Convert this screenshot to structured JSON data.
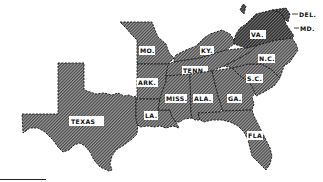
{
  "map": {
    "title": "Southern States",
    "fill_pattern": "diagonal-hatch",
    "colors": {
      "hatch": "#4a4a4a",
      "highlight_hatch": "#2e2e2e",
      "label_bg": "#ffffff",
      "border": "#1a1a1a"
    },
    "states": [
      {
        "id": "texas",
        "label": "TEXAS"
      },
      {
        "id": "missouri",
        "label": "MO."
      },
      {
        "id": "arkansas",
        "label": "ARK."
      },
      {
        "id": "louisiana",
        "label": "LA."
      },
      {
        "id": "kentucky",
        "label": "KY."
      },
      {
        "id": "tennessee",
        "label": "TENN."
      },
      {
        "id": "mississippi",
        "label": "MISS."
      },
      {
        "id": "alabama",
        "label": "ALA."
      },
      {
        "id": "georgia",
        "label": "GA."
      },
      {
        "id": "florida",
        "label": "FLA."
      },
      {
        "id": "south-carolina",
        "label": "S.C."
      },
      {
        "id": "north-carolina",
        "label": "N.C."
      },
      {
        "id": "virginia",
        "label": "VA."
      }
    ],
    "callouts": [
      {
        "id": "delaware",
        "label": "DEL."
      },
      {
        "id": "maryland",
        "label": "MD."
      }
    ]
  }
}
